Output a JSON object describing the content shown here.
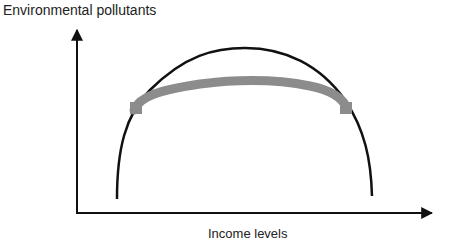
{
  "diagram": {
    "title": "",
    "y_axis_label": "Environmental pollutants",
    "x_axis_label": "Income levels",
    "curves": [
      {
        "name": "inverted-u-curve",
        "color": "#111111",
        "description": "Environmental Kuznets curve (inverted U)"
      },
      {
        "name": "flattened-curve",
        "color": "#8c8c8c",
        "description": "Flattened curve connecting two points on the inverted U"
      }
    ]
  }
}
